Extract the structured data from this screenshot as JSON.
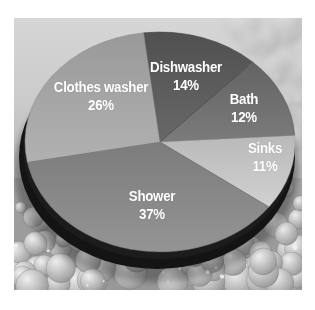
{
  "figure": {
    "description_label": "",
    "background_texture": "soap-bubbles-photo",
    "background_top_color": "#d6d6d6",
    "background_bottom_color": "#9a9a9a",
    "label_text_color": "#ffffff"
  },
  "chart_data": {
    "type": "pie",
    "style": "3d",
    "title": "",
    "legend": "none",
    "direction": "clockwise",
    "start_angle_deg": 97,
    "label_color": "#ffffff",
    "rim_color": "#141414",
    "slices": [
      {
        "label": "Dishwasher",
        "value": 14,
        "pct_text": "14%",
        "color": "#5a5a5a"
      },
      {
        "label": "Bath",
        "value": 12,
        "pct_text": "12%",
        "color": "#6d6d6d"
      },
      {
        "label": "Sinks",
        "value": 11,
        "pct_text": "11%",
        "color": "#c3c3c3"
      },
      {
        "label": "Shower",
        "value": 37,
        "pct_text": "37%",
        "color": "#868686"
      },
      {
        "label": "Clothes washer",
        "value": 26,
        "pct_text": "26%",
        "color": "#a3a3a3"
      }
    ]
  }
}
